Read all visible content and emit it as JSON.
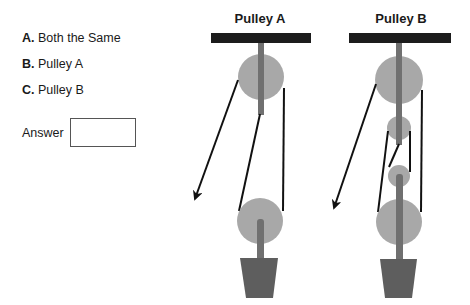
{
  "options": [
    {
      "letter": "A.",
      "text": "Both the Same"
    },
    {
      "letter": "B.",
      "text": "Pulley A"
    },
    {
      "letter": "C.",
      "text": "Pulley B"
    }
  ],
  "answer": {
    "label": "Answer",
    "value": ""
  },
  "diagrams": [
    {
      "title": "Pulley A"
    },
    {
      "title": "Pulley B"
    }
  ],
  "colors": {
    "beam": "#1c1c1c",
    "wheel": "#a8a8a8",
    "rod": "#707070",
    "load": "#5e5e5e",
    "rope": "#111111"
  }
}
